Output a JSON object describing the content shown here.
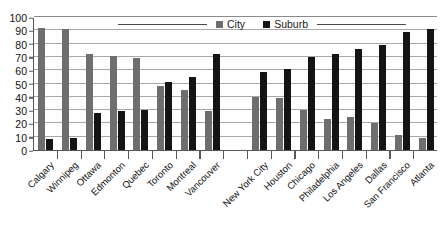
{
  "chart_data": {
    "type": "bar",
    "title": "",
    "subtitle": "",
    "xlabel": "",
    "ylabel": "",
    "ylim": [
      0,
      100
    ],
    "ytick_step": 10,
    "yticks": [
      100,
      90,
      80,
      70,
      60,
      50,
      40,
      30,
      20,
      10,
      0
    ],
    "grid": true,
    "legend_position": "top-center",
    "orientation": "vertical",
    "group_gap_after_index": 7,
    "categories": [
      "Calgary",
      "Winnipeg",
      "Ottawa",
      "Edmonton",
      "Quebec",
      "Toronto",
      "Montreal",
      "Vancouver",
      "New York City",
      "Houston",
      "Chicago",
      "Philadelphia",
      "Los Angeles",
      "Dallas",
      "San Francisco",
      "Atlanta"
    ],
    "series": [
      {
        "name": "City",
        "color": "#6e6e6e",
        "values": [
          92,
          91,
          72,
          71,
          69,
          48,
          45,
          29,
          40,
          39,
          30,
          23,
          25,
          20,
          11,
          9
        ]
      },
      {
        "name": "Suburb",
        "color": "#141414",
        "values": [
          8,
          9,
          28,
          29,
          30,
          51,
          55,
          72,
          59,
          61,
          70,
          72,
          76,
          79,
          89,
          91
        ]
      }
    ]
  },
  "legend": {
    "items": [
      {
        "label": "City",
        "color": "#6e6e6e"
      },
      {
        "label": "Suburb",
        "color": "#141414"
      }
    ]
  },
  "colors": {
    "city": "#6e6e6e",
    "suburb": "#141414",
    "axis": "#585858",
    "gridline": "#a8a8a8",
    "text": "#111111",
    "background": "#ffffff"
  }
}
